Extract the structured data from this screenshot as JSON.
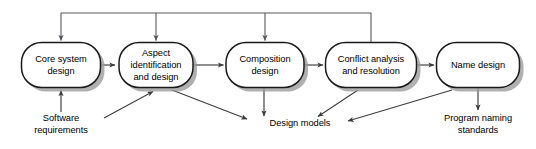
{
  "diagram": {
    "type": "flow-diagram",
    "colors": {
      "box_fill": "#ffffff",
      "box_stroke": "#1a1a1a",
      "shadow": "#9a9a9a",
      "arrow": "#3c3c3c",
      "feedback_arrow": "#55585c",
      "text": "#000000",
      "background": "#ffffff"
    },
    "nodes": [
      {
        "id": "core-system-design",
        "lines": [
          "Core system",
          "design"
        ],
        "x": 61,
        "y": 65,
        "w": 79,
        "h": 45
      },
      {
        "id": "aspect-identification-and-design",
        "lines": [
          "Aspect",
          "identification",
          "and design"
        ],
        "x": 156,
        "y": 65,
        "w": 74,
        "h": 45
      },
      {
        "id": "composition-design",
        "lines": [
          "Composition",
          "design"
        ],
        "x": 265,
        "y": 65,
        "w": 78,
        "h": 45
      },
      {
        "id": "conflict-analysis-and-resolution",
        "lines": [
          "Conflict analysis",
          "and resolution"
        ],
        "x": 371,
        "y": 65,
        "w": 91,
        "h": 45
      },
      {
        "id": "name-design",
        "lines": [
          "Name design"
        ],
        "x": 478,
        "y": 65,
        "w": 83,
        "h": 45
      }
    ],
    "external_labels": [
      {
        "id": "software-requirements",
        "lines": [
          "Software",
          "requirements"
        ],
        "x": 61,
        "y": 123
      },
      {
        "id": "design-models",
        "lines": [
          "Design models"
        ],
        "x": 300,
        "y": 123
      },
      {
        "id": "program-naming-standards",
        "lines": [
          "Program naming",
          "standards"
        ],
        "x": 478,
        "y": 123
      }
    ],
    "edges": [
      {
        "id": "core-to-aspect",
        "kind": "forward"
      },
      {
        "id": "aspect-to-composition",
        "kind": "forward"
      },
      {
        "id": "composition-to-conflict",
        "kind": "forward"
      },
      {
        "id": "conflict-to-name",
        "kind": "forward"
      },
      {
        "id": "requirements-to-core",
        "kind": "input"
      },
      {
        "id": "requirements-to-aspect",
        "kind": "input-diagonal"
      },
      {
        "id": "aspect-to-design-models",
        "kind": "output-diagonal"
      },
      {
        "id": "composition-to-design-models",
        "kind": "output"
      },
      {
        "id": "conflict-to-design-models",
        "kind": "output-diagonal"
      },
      {
        "id": "name-to-design-models",
        "kind": "output-diagonal"
      },
      {
        "id": "name-to-program-naming-standards",
        "kind": "output"
      },
      {
        "id": "conflict-feedback-to-core",
        "kind": "feedback"
      },
      {
        "id": "conflict-feedback-to-aspect",
        "kind": "feedback"
      },
      {
        "id": "conflict-feedback-to-composition",
        "kind": "feedback"
      }
    ]
  }
}
